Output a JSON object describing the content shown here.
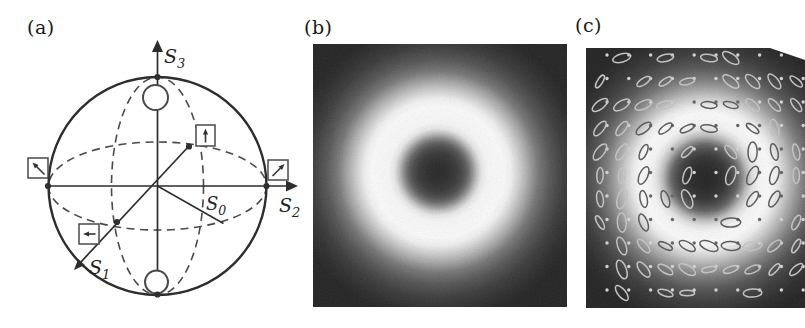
{
  "panels": {
    "a": {
      "label": "(a)"
    },
    "b": {
      "label": "(b)"
    },
    "c": {
      "label": "(c)"
    }
  },
  "panel_a": {
    "type": "poincare-sphere-diagram",
    "ink_color": "#2d2d2d",
    "dash_color": "#4a4a4a",
    "axes": {
      "s3": {
        "base": "S",
        "sub": "3"
      },
      "s2": {
        "base": "S",
        "sub": "2"
      },
      "s1": {
        "base": "S",
        "sub": "1"
      },
      "s0": {
        "base": "S",
        "sub": "0"
      }
    },
    "markers": {
      "top_pole": "circular-polarization-icon",
      "bottom_pole": "circular-polarization-icon",
      "right_equator": "plus45-linear-polarization-icon",
      "left_equator": "minus45-linear-polarization-icon",
      "back_equator": "vertical-linear-polarization-icon",
      "front_s1": "horizontal-linear-polarization-icon"
    }
  },
  "panel_b": {
    "type": "doughnut-beam-intensity-image",
    "background": "#121212",
    "gradient_stops": [
      [
        0.0,
        "#181818"
      ],
      [
        0.07,
        "#1e1e1e"
      ],
      [
        0.13,
        "#2c2c2c"
      ],
      [
        0.17,
        "#404040"
      ],
      [
        0.2,
        "#5c5c5c"
      ],
      [
        0.23,
        "#8a8a8a"
      ],
      [
        0.26,
        "#c0c0c0"
      ],
      [
        0.29,
        "#e9e9e9"
      ],
      [
        0.33,
        "#fbfbfb"
      ],
      [
        0.44,
        "#ffffff"
      ],
      [
        0.49,
        "#f3f3f3"
      ],
      [
        0.54,
        "#d2d2d2"
      ],
      [
        0.6,
        "#a6a6a6"
      ],
      [
        0.67,
        "#6f6f6f"
      ],
      [
        0.75,
        "#4a4a4a"
      ],
      [
        0.84,
        "#2e2e2e"
      ],
      [
        0.93,
        "#1e1e1e"
      ],
      [
        1.0,
        "#151515"
      ]
    ],
    "center": {
      "x": 125,
      "y": 128
    },
    "gradient_radius": 150
  },
  "panel_c": {
    "type": "doughnut-beam-with-polarization-ellipses",
    "background": "#131313",
    "gradient_stops": [
      [
        0.0,
        "#141414"
      ],
      [
        0.08,
        "#191919"
      ],
      [
        0.14,
        "#262626"
      ],
      [
        0.18,
        "#3a3a3a"
      ],
      [
        0.22,
        "#585858"
      ],
      [
        0.25,
        "#868686"
      ],
      [
        0.28,
        "#b9b9b9"
      ],
      [
        0.32,
        "#e4e4e4"
      ],
      [
        0.36,
        "#f9f9f9"
      ],
      [
        0.43,
        "#ffffff"
      ],
      [
        0.48,
        "#f0f0f0"
      ],
      [
        0.53,
        "#cfcfcf"
      ],
      [
        0.59,
        "#a3a3a3"
      ],
      [
        0.66,
        "#727272"
      ],
      [
        0.74,
        "#4a4a4a"
      ],
      [
        0.83,
        "#2e2e2e"
      ],
      [
        0.92,
        "#1d1d1d"
      ],
      [
        1.0,
        "#141414"
      ]
    ],
    "center": {
      "x": 119,
      "y": 130
    },
    "gradient_radius": 150,
    "overlay": {
      "rows": 11,
      "cols": 10,
      "x0": 14,
      "y0": 10,
      "dx": 21.8,
      "dy": 23.5,
      "cx": 119,
      "cy": 130,
      "ring_inner": 38,
      "ring_outer": 80,
      "ellipse_rx": 8.2,
      "ellipse_ry": 3.1,
      "stroke_width": 1.5,
      "dot_r": 1.7,
      "ellipse_threshold": 0.32,
      "light": "#c4c4c4",
      "dark": "#4f4f4f",
      "dot_light": "#d6d6d6",
      "dot_dark": "#5a5a5a"
    }
  }
}
